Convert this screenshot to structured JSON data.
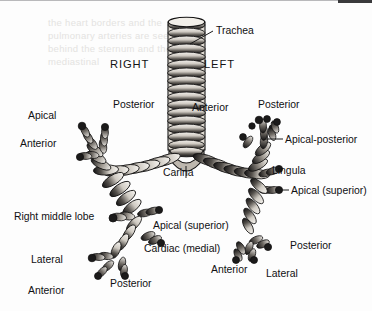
{
  "figure": {
    "background_color": "#fdfdfd",
    "ink_color": "#1a1a1a",
    "bleed_through_text": "the heart borders and the pulmonary arteries are seen behind the sternum and the mediastinal"
  },
  "orientation": {
    "right_label": "RIGHT",
    "left_label": "LEFT"
  },
  "labels": {
    "trachea": "Trachea",
    "carina": "Carina",
    "right_apical": "Apical",
    "right_posterior": "Posterior",
    "right_anterior": "Anterior",
    "right_middle_lobe": "Right middle lobe",
    "right_lateral": "Lateral",
    "right_lower_anterior": "Anterior",
    "right_lower_posterior": "Posterior",
    "right_apical_superior": "Apical (superior)",
    "right_cardiac_medial": "Cardiac (medial)",
    "left_anterior": "Anterior",
    "left_posterior": "Posterior",
    "left_apical_posterior": "Apical-posterior",
    "left_lingula": "Lingula",
    "left_apical_superior": "Apical (superior)",
    "left_lower_posterior": "Posterior",
    "left_lower_anterior": "Anterior",
    "left_lower_lateral": "Lateral"
  }
}
